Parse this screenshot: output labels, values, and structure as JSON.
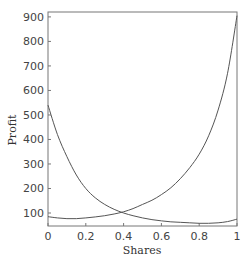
{
  "chart_data": {
    "type": "line",
    "title": "",
    "xlabel": "Shares",
    "ylabel": "Profit",
    "xlim": [
      0,
      1
    ],
    "ylim": [
      47,
      920
    ],
    "grid": false,
    "legend": null,
    "x_ticks": [
      0,
      0.2,
      0.4,
      0.6,
      0.8,
      1
    ],
    "x_tick_labels": [
      "0",
      "0.2",
      "0.4",
      "0.6",
      "0.8",
      "1"
    ],
    "y_ticks": [
      100,
      200,
      300,
      400,
      500,
      600,
      700,
      800,
      900
    ],
    "y_tick_labels": [
      "100",
      "200",
      "300",
      "400",
      "500",
      "600",
      "700",
      "800",
      "900"
    ],
    "x": [
      0,
      0.05,
      0.1,
      0.15,
      0.2,
      0.25,
      0.3,
      0.35,
      0.4,
      0.45,
      0.5,
      0.55,
      0.6,
      0.65,
      0.7,
      0.75,
      0.8,
      0.85,
      0.9,
      0.95,
      1.0
    ],
    "series": [
      {
        "name": "decreasing curve",
        "color": "#555555",
        "values": [
          540,
          420,
          330,
          255,
          200,
          162,
          135,
          115,
          100,
          89,
          80,
          73,
          68,
          64,
          62,
          60,
          58,
          58,
          60,
          65,
          75
        ]
      },
      {
        "name": "increasing curve",
        "color": "#555555",
        "values": [
          85,
          80,
          77,
          77,
          80,
          84,
          89,
          96,
          105,
          118,
          135,
          152,
          175,
          203,
          240,
          285,
          340,
          415,
          520,
          670,
          905
        ]
      }
    ]
  }
}
